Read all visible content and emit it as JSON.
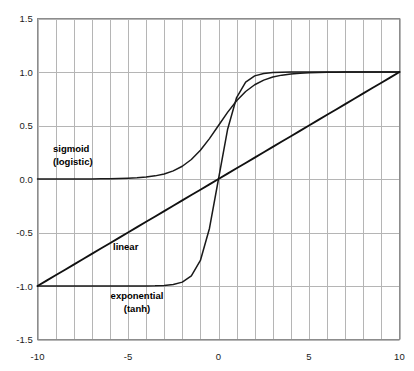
{
  "chart_data": {
    "type": "line",
    "title": "",
    "subtitle": "",
    "xlabel": "",
    "ylabel": "",
    "xlim": [
      -10,
      10
    ],
    "ylim": [
      -1.5,
      1.5
    ],
    "grid": true,
    "grid_x_step": 1,
    "grid_y_step": 0.5,
    "legend_position": "inline-annotations",
    "x_tick_labels": [
      "-10",
      "-5",
      "0",
      "5",
      "10"
    ],
    "x_tick_values": [
      -10,
      -5,
      0,
      5,
      10
    ],
    "y_tick_labels": [
      "1.5",
      "1.0",
      "0.5",
      "0.0",
      "-0.5",
      "-1.0",
      "-1.5"
    ],
    "y_tick_values": [
      1.5,
      1.0,
      0.5,
      0.0,
      -0.5,
      -1.0,
      -1.5
    ],
    "x": [
      -10,
      -9.5,
      -9,
      -8.5,
      -8,
      -7.5,
      -7,
      -6.5,
      -6,
      -5.5,
      -5,
      -4.5,
      -4,
      -3.5,
      -3,
      -2.5,
      -2,
      -1.5,
      -1,
      -0.5,
      0,
      0.5,
      1,
      1.5,
      2,
      2.5,
      3,
      3.5,
      4,
      4.5,
      5,
      5.5,
      6,
      6.5,
      7,
      7.5,
      8,
      8.5,
      9,
      9.5,
      10
    ],
    "series": [
      {
        "name": "sigmoid (logistic)",
        "label_line1": "sigmoid",
        "label_line2": "(logistic)",
        "color": "#1a1a1a",
        "values": [
          0.0,
          0.0001,
          0.0001,
          0.0002,
          0.0003,
          0.0006,
          0.0009,
          0.0015,
          0.0025,
          0.0041,
          0.0067,
          0.011,
          0.018,
          0.0293,
          0.0474,
          0.0759,
          0.1192,
          0.1824,
          0.2689,
          0.3775,
          0.5,
          0.6225,
          0.7311,
          0.8176,
          0.8808,
          0.9241,
          0.9526,
          0.9707,
          0.982,
          0.989,
          0.9933,
          0.9959,
          0.9975,
          0.9985,
          0.9991,
          0.9994,
          0.9997,
          0.9998,
          0.9999,
          0.9999,
          1.0
        ]
      },
      {
        "name": "exponential (tanh)",
        "label_line1": "exponential",
        "label_line2": "(tanh)",
        "color": "#1a1a1a",
        "values": [
          -1.0,
          -1.0,
          -1.0,
          -1.0,
          -1.0,
          -1.0,
          -1.0,
          -1.0,
          -0.9999,
          -0.9999,
          -0.9999,
          -0.9998,
          -0.9993,
          -0.9982,
          -0.9951,
          -0.9866,
          -0.964,
          -0.9051,
          -0.7616,
          -0.4621,
          0.0,
          0.4621,
          0.7616,
          0.9051,
          0.964,
          0.9866,
          0.9951,
          0.9982,
          0.9993,
          0.9998,
          0.9999,
          0.9999,
          0.9999,
          1.0,
          1.0,
          1.0,
          1.0,
          1.0,
          1.0,
          1.0,
          1.0
        ]
      },
      {
        "name": "linear",
        "label_line1": "linear",
        "label_line2": "",
        "color": "#111111",
        "values": [
          -1.0,
          -0.95,
          -0.9,
          -0.85,
          -0.8,
          -0.75,
          -0.7,
          -0.65,
          -0.6,
          -0.55,
          -0.5,
          -0.45,
          -0.4,
          -0.35,
          -0.3,
          -0.25,
          -0.2,
          -0.15,
          -0.1,
          -0.05,
          0.0,
          0.05,
          0.1,
          0.15,
          0.2,
          0.25,
          0.3,
          0.35,
          0.4,
          0.45,
          0.5,
          0.55,
          0.6,
          0.65,
          0.7,
          0.75,
          0.8,
          0.85,
          0.9,
          0.95,
          1.0
        ]
      }
    ],
    "colors": {
      "grid": "#b5b5b5",
      "axis": "#8c8c8c",
      "curve": "#1a1a1a",
      "text": "#1a1a1a",
      "background": "#ffffff"
    }
  },
  "annotations": {
    "sigmoid": {
      "line1": "sigmoid",
      "line2": "(logistic)"
    },
    "linear": {
      "line1": "linear"
    },
    "exponential": {
      "line1": "exponential",
      "line2": "(tanh)"
    }
  }
}
